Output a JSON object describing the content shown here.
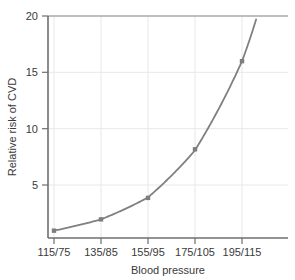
{
  "chart_data": {
    "type": "line",
    "title": "",
    "xlabel": "Blood pressure",
    "ylabel": "Relative risk of CVD",
    "categories": [
      "115/75",
      "135/85",
      "155/95",
      "175/105",
      "195/115"
    ],
    "values": [
      1.0,
      2.0,
      3.9,
      8.2,
      16.0
    ],
    "series": [
      {
        "name": "Relative risk of CVD",
        "values": [
          1.0,
          2.0,
          3.9,
          8.2,
          16.0
        ]
      }
    ],
    "ylim": [
      0.35,
      20
    ],
    "yticks": [
      5,
      10,
      15,
      20
    ],
    "ytick_labels": [
      "5",
      "10",
      "15",
      "20"
    ],
    "xtick_labels": [
      "115/75",
      "135/85",
      "155/95",
      "175/105",
      "195/115"
    ],
    "grid": true,
    "legend": "none",
    "curve_extends_beyond_last_point": true,
    "curve_end_value": 19.7,
    "marker": "square",
    "colors": {
      "line": "#808080",
      "marker": "#7d7d7d",
      "grid": "#e8e8e8",
      "axis": "#6e6e6e",
      "text": "#3a3a3a",
      "background": "#ffffff"
    }
  }
}
